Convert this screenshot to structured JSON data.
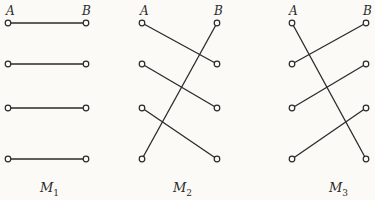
{
  "diagrams": [
    {
      "label": "M",
      "subscript": "1",
      "left_label": "A",
      "right_label": "B",
      "ax": 8,
      "bx": 86,
      "connections": [
        [
          0,
          0
        ],
        [
          1,
          1
        ],
        [
          2,
          2
        ],
        [
          3,
          3
        ]
      ]
    },
    {
      "label": "M",
      "subscript": "2",
      "left_label": "A",
      "right_label": "B",
      "ax": 142,
      "bx": 217,
      "connections": [
        [
          0,
          1
        ],
        [
          1,
          2
        ],
        [
          2,
          3
        ],
        [
          3,
          0
        ]
      ]
    },
    {
      "label": "M",
      "subscript": "3",
      "left_label": "A",
      "right_label": "B",
      "ax": 292,
      "bx": 366,
      "connections": [
        [
          0,
          3
        ],
        [
          1,
          0
        ],
        [
          2,
          1
        ],
        [
          3,
          2
        ]
      ]
    }
  ],
  "rows_y": [
    23,
    64,
    108,
    159
  ],
  "colors": {
    "line": "#2a2a2a",
    "background": "#fbfaf6"
  }
}
